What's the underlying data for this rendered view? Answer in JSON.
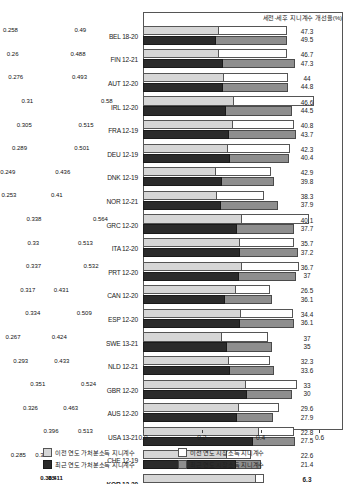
{
  "header": {
    "note": "세전-세후 지니계수 개선율(%)"
  },
  "axis": {
    "ticks": [
      "0.0",
      "0.2",
      "0.4",
      "0.6"
    ],
    "tick_values": [
      0.0,
      0.2,
      0.4,
      0.6
    ],
    "xmin": 0.0,
    "xmax": 0.68
  },
  "legend": [
    {
      "key": "prev-disposable",
      "swatch": "sw-prev-disp",
      "label": "이전 연도 가처분소득 지니계수"
    },
    {
      "key": "prev-market",
      "swatch": "sw-prev-mkt",
      "label": "이전 연도 시장소득 지니계수"
    },
    {
      "key": "recent-disposable",
      "swatch": "sw-rec-disp",
      "label": "최근 연도 가처분소득 지니계수"
    },
    {
      "key": "recent-market",
      "swatch": "sw-rec-mkt",
      "label": "최근 연도 시장소득 지니계수"
    }
  ],
  "chart_data": {
    "type": "bar",
    "title": "",
    "xlabel": "",
    "ylabel": "",
    "xlim": [
      0.0,
      0.68
    ],
    "grid": false,
    "legend_position": "bottom",
    "categories": [
      "BEL 18-20",
      "FIN 12-21",
      "AUT 12-20",
      "IRL 12-20",
      "FRA 12-19",
      "DEU 12-19",
      "DNK 12-19",
      "NOR 12-21",
      "GRC 12-20",
      "ITA 12-20",
      "PRT 12-20",
      "CAN 12-20",
      "ESP 12-20",
      "SWE 13-21",
      "NLD 12-21",
      "GBR 12-20",
      "AUS 12-20",
      "USA 13-21",
      "CHE 12-19",
      "KOR 12-20"
    ],
    "series": [
      {
        "name": "이전 연도 가처분소득 지니계수",
        "values": [
          0.258,
          0.26,
          0.276,
          0.31,
          0.305,
          0.289,
          0.249,
          0.253,
          0.338,
          0.33,
          0.337,
          0.317,
          0.334,
          0.267,
          0.293,
          0.351,
          0.326,
          0.396,
          0.285,
          0.385
        ]
      },
      {
        "name": "이전 연도 시장소득 지니계수",
        "values": [
          0.49,
          0.488,
          0.493,
          0.58,
          0.515,
          0.501,
          0.436,
          0.41,
          0.564,
          0.513,
          0.532,
          0.431,
          0.509,
          0.424,
          0.433,
          0.524,
          0.463,
          0.513,
          0.368,
          0.411
        ]
      },
      {
        "name": "최근 연도 가처분소득 지니계수",
        "values": [
          0.248,
          0.273,
          0.272,
          0.282,
          0.292,
          0.296,
          0.268,
          0.265,
          0.32,
          0.331,
          0.327,
          0.28,
          0.329,
          0.286,
          0.297,
          0.355,
          0.318,
          0.375,
          0.316,
          0.331
        ]
      },
      {
        "name": "최근 연도 시장소득 지니계수",
        "values": [
          0.491,
          0.518,
          0.493,
          0.508,
          0.519,
          0.497,
          0.445,
          0.459,
          0.514,
          0.527,
          0.519,
          0.438,
          0.515,
          0.44,
          0.447,
          0.507,
          0.441,
          0.517,
          0.402,
          0.405
        ]
      }
    ],
    "improvement_rate_prev": [
      47.3,
      46.7,
      44,
      46.6,
      40.8,
      42.3,
      42.9,
      38.3,
      40.1,
      35.7,
      36.7,
      26.5,
      34.4,
      37,
      32.3,
      33,
      29.6,
      22.8,
      22.6,
      6.3
    ],
    "improvement_rate_recent": [
      49.5,
      47.3,
      44.8,
      44.5,
      43.7,
      40.4,
      39.8,
      37.9,
      37.7,
      37.2,
      37,
      36.1,
      36.1,
      35,
      33.6,
      30,
      27.9,
      27.5,
      21.4,
      18.3
    ],
    "rate_labels_prev": [
      "47.3",
      "46.7",
      "44",
      "46.6",
      "40.8",
      "42.3",
      "42.9",
      "38.3",
      "40.1",
      "35.7",
      "36.7",
      "26.5",
      "34.4",
      "37",
      "32.3",
      "33",
      "29.6",
      "22.8",
      "22.6",
      "6.3"
    ],
    "rate_labels_recent": [
      "49.5",
      "47.3",
      "44.8",
      "44.5",
      "43.7",
      "40.4",
      "39.8",
      "37.9",
      "37.7",
      "37.2",
      "37",
      "36.1",
      "36.1",
      "35",
      "33.6",
      "30",
      "27.9",
      "27.5",
      "21.4",
      "18.3"
    ],
    "bar_labels_prev_disp": [
      "0.258",
      "0.26",
      "0.276",
      "0.31",
      "0.305",
      "0.289",
      "0.249",
      "0.253",
      "0.338",
      "0.33",
      "0.337",
      "0.317",
      "0.334",
      "0.267",
      "0.293",
      "0.351",
      "0.326",
      "0.396",
      "0.285",
      "0.385"
    ],
    "bar_labels_prev_mkt": [
      "0.49",
      "0.488",
      "0.493",
      "0.58",
      "0.515",
      "0.501",
      "0.436",
      "0.41",
      "0.564",
      "0.513",
      "0.532",
      "0.431",
      "0.509",
      "0.424",
      "0.433",
      "0.524",
      "0.463",
      "0.513",
      "0.368",
      "0.411"
    ],
    "bar_labels_recent_disp": [
      "0.248",
      "0.273",
      "0.272",
      "0.282",
      "0.292",
      "0.296",
      "0.268",
      "0.265",
      "0.32",
      "0.331",
      "0.327",
      "0.28",
      "0.329",
      "0.286",
      "0.297",
      "0.355",
      "0.318",
      "0.375",
      "0.316",
      "0.331"
    ],
    "bar_labels_recent_mkt": [
      "0.491",
      "0.518",
      "0.493",
      "0.508",
      "0.519",
      "0.497",
      "0.445",
      "0.459",
      "0.514",
      "0.527",
      "0.519",
      "0.438",
      "0.515",
      "0.44",
      "0.447",
      "0.507",
      "0.441",
      "0.517",
      "0.402",
      "0.405"
    ],
    "highlight_category": "KOR 12-20"
  }
}
